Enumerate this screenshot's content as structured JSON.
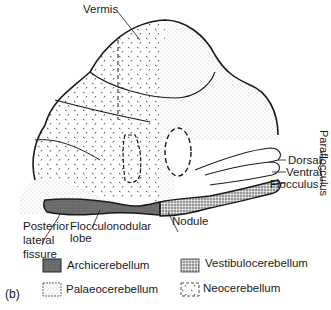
{
  "figure": {
    "panel_label": "(b)",
    "colors": {
      "outline": "#1a1a1a",
      "archicerebellum_fill": "#6e6e6e",
      "palaeo_fill": "#e6e6e6",
      "background": "#ffffff"
    }
  },
  "labels": {
    "vermis": "Vermis",
    "dorsal": "Dorsal",
    "ventral": "Ventral",
    "flocculus": "Flocculus",
    "paraflocculus": "Paraflocculus",
    "flocculonodular_lobe_line1": "Flocculonodular",
    "flocculonodular_lobe_line2": "lobe",
    "posterior_lateral_fissure_line1": "Posterior",
    "posterior_lateral_fissure_line2": "lateral",
    "posterior_lateral_fissure_line3": "fissure",
    "nodule": "Nodule"
  },
  "legend": [
    {
      "label": "Archicerebellum",
      "pattern": "dark-stipple"
    },
    {
      "label": "Vestibulocerebellum",
      "pattern": "dense-stipple"
    },
    {
      "label": "Palaeocerebellum",
      "pattern": "fine-stipple"
    },
    {
      "label": "Neocerebellum",
      "pattern": "sparse-ticks"
    }
  ]
}
